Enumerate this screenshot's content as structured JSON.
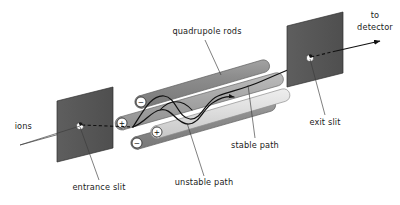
{
  "figure": {
    "background": "#ffffff",
    "width": 400,
    "height": 205
  },
  "labels": {
    "ions": "ions",
    "entrance_slit": "entrance slit",
    "quadrupole_rods": "quadrupole rods",
    "unstable_path": "unstable path",
    "stable_path": "stable path",
    "exit_slit": "exit slit",
    "to_detector_line1": "to",
    "to_detector_line2": "detector"
  },
  "electrode_signs": {
    "upper_rear": "−",
    "mid_rear": "+",
    "mid_front": "+",
    "lower_front": "−"
  },
  "colors": {
    "plate_fill": "#595959",
    "plate_edge": "#2e2e2e",
    "rod_dark": "#8a8a8a",
    "rod_dark_edge": "#5a5a5a",
    "rod_light": "#dcdcdc",
    "rod_light_edge": "#8e8e8e",
    "rod_mid": "#a8a8a8",
    "path_stroke": "#111111",
    "leader_stroke": "#3a3a3a",
    "text": "#1b1b1b",
    "slit_hole": "#ffffff"
  },
  "components": {
    "entrance_plate": "ion entrance aperture plate",
    "exit_plate": "ion exit aperture plate",
    "rod_count": 4,
    "stable_trajectory": "oscillating ion path that exits through the exit slit",
    "unstable_trajectory": "oscillating ion path that terminates on a rod"
  }
}
